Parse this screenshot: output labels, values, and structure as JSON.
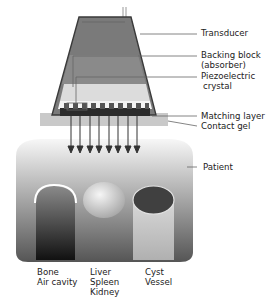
{
  "labels": {
    "transducer": "Transducer",
    "backing_block_1": "Backing block",
    "backing_block_2": "(absorber)",
    "piezo_1": "Piezoelectric",
    "piezo_2": "crystal",
    "matching_layer": "Matching layer",
    "contact_gel": "Contact gel",
    "patient": "Patient"
  },
  "tissues": [
    {
      "line1": "Bone",
      "line2": "Air cavity",
      "line3": ""
    },
    {
      "line1": "Liver",
      "line2": "Spleen",
      "line3": "Kidney"
    },
    {
      "line1": "Cyst",
      "line2": "Vessel",
      "line3": ""
    }
  ]
}
